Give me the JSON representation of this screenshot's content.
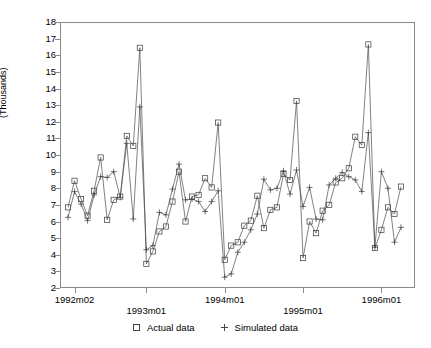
{
  "chart_data": {
    "type": "line",
    "title": "",
    "subtitle": "",
    "xlabel": "",
    "ylabel": "(Thousands)",
    "ylim": [
      2,
      18
    ],
    "ytick_values": [
      2,
      3,
      4,
      5,
      6,
      7,
      8,
      9,
      10,
      11,
      12,
      13,
      14,
      15,
      16,
      17,
      18
    ],
    "ytick_labels": [
      "2",
      "3",
      "4",
      "5",
      "6",
      "7",
      "8",
      "9",
      "10",
      "11",
      "12",
      "13",
      "14",
      "15",
      "16",
      "17",
      "18"
    ],
    "xtick_labels": [
      "1992m02",
      "1993m01",
      "1994m01",
      "1995m01",
      "1996m01"
    ],
    "xtick_positions": [
      2,
      13,
      25,
      37,
      49
    ],
    "grid": false,
    "legend_position": "bottom-center",
    "x": [
      1,
      2,
      3,
      4,
      5,
      6,
      7,
      8,
      9,
      10,
      11,
      12,
      13,
      14,
      15,
      16,
      17,
      18,
      19,
      20,
      21,
      22,
      23,
      24,
      25,
      26,
      27,
      28,
      29,
      30,
      31,
      32,
      33,
      34,
      35,
      36,
      37,
      38,
      39,
      40,
      41,
      42,
      43,
      44,
      45,
      46,
      47,
      48,
      49,
      50,
      51,
      52,
      53,
      54,
      55,
      56,
      57,
      58,
      59,
      60
    ],
    "x_period_labels": [
      "1992m01",
      "1992m02",
      "1992m03",
      "1992m04",
      "1992m05",
      "1992m06",
      "1992m07",
      "1992m08",
      "1992m09",
      "1992m10",
      "1992m11",
      "1992m12",
      "1993m01",
      "1993m02",
      "1993m03",
      "1993m04",
      "1993m05",
      "1993m06",
      "1993m07",
      "1993m08",
      "1993m09",
      "1993m10",
      "1993m11",
      "1993m12",
      "1994m01",
      "1994m02",
      "1994m03",
      "1994m04",
      "1994m05",
      "1994m06",
      "1994m07",
      "1994m08",
      "1994m09",
      "1994m10",
      "1994m11",
      "1994m12",
      "1995m01",
      "1995m02",
      "1995m03",
      "1995m04",
      "1995m05",
      "1995m06",
      "1995m07",
      "1995m08",
      "1995m09",
      "1995m10",
      "1995m11",
      "1995m12",
      "1996m01",
      "1996m02",
      "1996m03",
      "1996m04",
      "1996m05",
      "1996m06",
      "1996m07",
      "1996m08",
      "1996m09",
      "1996m10",
      "1996m11",
      "1996m12"
    ],
    "series": [
      {
        "name": "Actual data",
        "marker": "square",
        "values": [
          6.85,
          8.45,
          7.35,
          6.35,
          7.85,
          9.85,
          6.1,
          7.3,
          7.5,
          11.15,
          10.55,
          16.45,
          3.45,
          4.2,
          5.4,
          5.7,
          7.2,
          9.0,
          6.0,
          7.5,
          7.6,
          8.6,
          8.05,
          11.95,
          3.7,
          4.55,
          4.75,
          5.75,
          6.05,
          7.55,
          5.6,
          6.7,
          6.85,
          8.85,
          8.5,
          13.25,
          3.8,
          6.0,
          5.3,
          6.65,
          7.0,
          8.35,
          8.6,
          9.2,
          11.1,
          10.6,
          16.65,
          4.4,
          5.5,
          6.85,
          6.45,
          8.1,
          null,
          null,
          null,
          null,
          null,
          null,
          null,
          null
        ]
      },
      {
        "name": "Simulated data",
        "marker": "plus",
        "values": [
          6.25,
          7.8,
          7.05,
          6.05,
          7.6,
          8.7,
          8.65,
          9.0,
          7.45,
          10.7,
          6.15,
          12.9,
          4.3,
          4.55,
          6.55,
          6.4,
          7.95,
          9.45,
          7.3,
          7.35,
          7.2,
          6.6,
          7.2,
          7.85,
          2.65,
          2.85,
          4.15,
          4.75,
          5.5,
          6.45,
          8.55,
          7.9,
          8.0,
          9.05,
          7.65,
          9.1,
          6.9,
          8.05,
          6.15,
          6.1,
          8.2,
          8.6,
          8.95,
          8.7,
          8.5,
          7.8,
          11.35,
          4.45,
          9.0,
          8.0,
          4.75,
          5.65,
          null,
          null,
          null,
          null,
          null,
          null,
          null,
          null
        ]
      }
    ]
  },
  "legend": {
    "entries": [
      {
        "label": "Actual data",
        "marker": "square-marker"
      },
      {
        "label": "Simulated data",
        "marker": "plus-marker"
      }
    ]
  },
  "axes": {
    "y_title": "(Thousands)"
  },
  "colors": {
    "line": "#4a4a4a",
    "marker": "#3a3a3a",
    "frame": "#8a8a8a",
    "background": "#ffffff"
  }
}
